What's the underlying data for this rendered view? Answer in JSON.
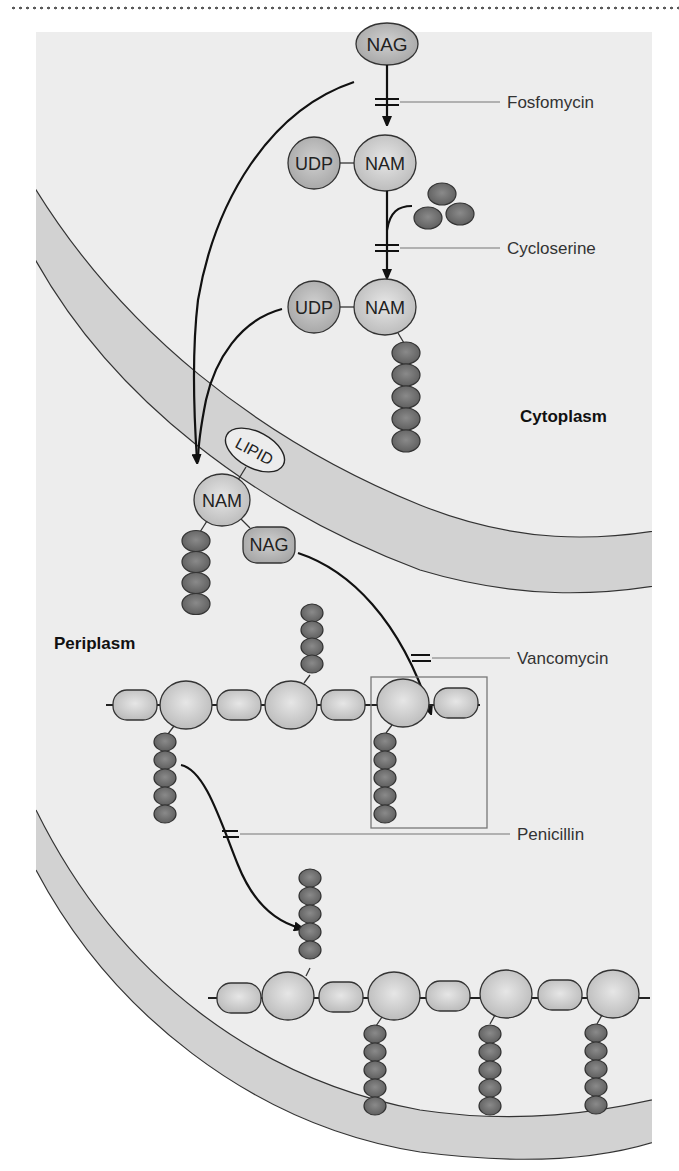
{
  "figure": {
    "regions": {
      "cytoplasm": "Cytoplasm",
      "periplasm": "Periplasm"
    },
    "molecules": {
      "nag_top": "NAG",
      "udp_1": "UDP",
      "nam_1": "NAM",
      "udp_2": "UDP",
      "nam_2": "NAM",
      "lipid": "LIPID",
      "nam_lipid": "NAM",
      "nag_lipid": "NAG"
    },
    "inhibitors": [
      {
        "name": "Fosfomycin",
        "step": "NAG to UDP-NAM"
      },
      {
        "name": "Cycloserine",
        "step": "UDP-NAM to UDP-NAM-pentapeptide"
      },
      {
        "name": "Vancomycin",
        "step": "Transglycosylation onto peptidoglycan chain"
      },
      {
        "name": "Penicillin",
        "step": "Transpeptidation cross-linking"
      }
    ],
    "colors": {
      "panel_bg": "#ededed",
      "membrane_fill": "#d2d2d2",
      "sugar_fill": "#c8c8c8",
      "peptide_fill": "#6e6e6e",
      "outline": "#333333"
    }
  }
}
